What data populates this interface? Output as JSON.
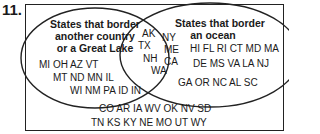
{
  "problem_number": "11.",
  "diagram": {
    "type": "venn",
    "left_set": {
      "label_lines": [
        "States that border",
        "another country",
        "or a Great Lake"
      ],
      "rows": [
        "MI OH AZ VT",
        "MT ND MN IL",
        "WI NM PA ID IN"
      ]
    },
    "right_set": {
      "label_lines": [
        "States that border",
        "an ocean"
      ],
      "rows": [
        "HI FL RI CT MD MA",
        "DE MS VA LA NJ",
        "GA OR NC AL SC"
      ]
    },
    "intersection": {
      "items": [
        "AK",
        "NY",
        "TX",
        "ME",
        "NH",
        "CA",
        "WA"
      ]
    },
    "outside": {
      "rows": [
        "CO AR IA WV OK NV SD",
        "TN KS KY NE MO UT WY"
      ]
    },
    "colors": {
      "stroke": "#222222",
      "text": "#1a1a1a",
      "background": "#ffffff"
    }
  }
}
